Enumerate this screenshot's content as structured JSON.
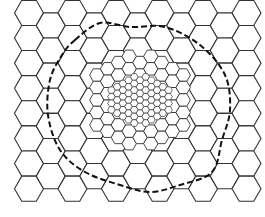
{
  "figure": {
    "width": 265,
    "height": 217,
    "background": "#ffffff",
    "stroke_color": "#333333",
    "dash_color": "#111111"
  },
  "mesh": {
    "coarse": {
      "size": 14.5,
      "origin_x": 29,
      "origin_y": 38,
      "cols": 9,
      "rows": 8
    },
    "medium": {
      "size": 7.2,
      "center_x": 140,
      "center_y": 100,
      "radius": 46
    },
    "fine": {
      "size": 3.8,
      "center_x": 140,
      "center_y": 100,
      "radius": 24
    }
  },
  "boundary": {
    "style": "dashed",
    "points": [
      [
        75,
        40
      ],
      [
        100,
        23
      ],
      [
        130,
        27
      ],
      [
        165,
        27
      ],
      [
        200,
        45
      ],
      [
        225,
        75
      ],
      [
        230,
        110
      ],
      [
        222,
        140
      ],
      [
        212,
        172
      ],
      [
        180,
        185
      ],
      [
        150,
        192
      ],
      [
        120,
        185
      ],
      [
        85,
        172
      ],
      [
        60,
        150
      ],
      [
        48,
        115
      ],
      [
        50,
        80
      ],
      [
        62,
        55
      ]
    ]
  }
}
